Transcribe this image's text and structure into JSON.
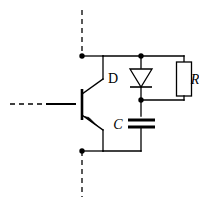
{
  "figure": {
    "kind": "schematic-circuit-diagram",
    "background_color": "#ffffff",
    "line_color": "#000000"
  },
  "labels": {
    "diode": "D",
    "resistor": "R",
    "capacitor": "C"
  },
  "components": [
    {
      "id": "transistor",
      "type": "bipolar-transistor-pnp",
      "terminals": [
        "collector",
        "base",
        "emitter"
      ]
    },
    {
      "id": "diode",
      "type": "diode",
      "label": "D",
      "orientation": "cathode-down"
    },
    {
      "id": "resistor",
      "type": "resistor",
      "label": "R",
      "orientation": "vertical"
    },
    {
      "id": "capacitor",
      "type": "capacitor",
      "label": "C",
      "orientation": "horizontal-plates"
    }
  ],
  "nodes": [
    {
      "id": "top-node",
      "type": "junction-dot"
    },
    {
      "id": "diode-top-node",
      "type": "junction-dot"
    },
    {
      "id": "diode-cathode-node",
      "type": "junction-dot"
    },
    {
      "id": "bottom-node",
      "type": "junction-dot"
    }
  ],
  "leads": [
    {
      "id": "collector-lead",
      "style": "dashed",
      "direction": "up"
    },
    {
      "id": "base-lead",
      "style": "dashed",
      "direction": "left"
    },
    {
      "id": "emitter-lead",
      "style": "dashed",
      "direction": "down"
    }
  ]
}
